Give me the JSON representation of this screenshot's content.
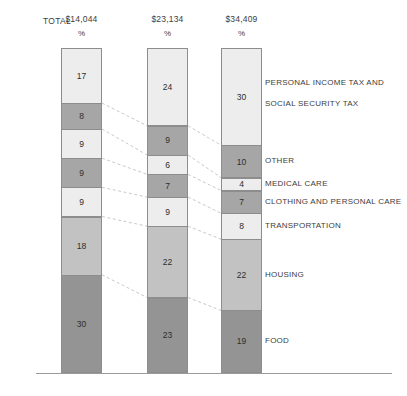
{
  "chart_data": {
    "type": "bar",
    "title": "",
    "subtitle": "",
    "xlabel": "",
    "ylabel": "",
    "grid": false,
    "legend_position": "right-labels",
    "stacked": true,
    "unit": "%",
    "ylim": [
      0,
      100
    ],
    "row_header": "TOTAL",
    "percent_symbol": "%",
    "categories": [
      "$14,044",
      "$23,134",
      "$34,409"
    ],
    "segment_labels": [
      "PERSONAL INCOME TAX AND\nSOCIAL SECURITY TAX",
      "OTHER",
      "MEDICAL CARE",
      "CLOTHING AND PERSONAL CARE",
      "TRANSPORTATION",
      "HOUSING",
      "FOOD"
    ],
    "series": [
      {
        "name": "PERSONAL INCOME TAX AND SOCIAL SECURITY TAX",
        "values": [
          17,
          24,
          30
        ],
        "color": "#ededed"
      },
      {
        "name": "OTHER",
        "values": [
          8,
          9,
          10
        ],
        "color": "#a6a6a6"
      },
      {
        "name": "MEDICAL CARE",
        "values": [
          9,
          6,
          4
        ],
        "color": "#ededed"
      },
      {
        "name": "CLOTHING AND PERSONAL CARE",
        "values": [
          9,
          7,
          7
        ],
        "color": "#a6a6a6"
      },
      {
        "name": "TRANSPORTATION",
        "values": [
          9,
          9,
          8
        ],
        "color": "#ededed"
      },
      {
        "name": "HOUSING",
        "values": [
          18,
          22,
          22
        ],
        "color": "#c2c2c2"
      },
      {
        "name": "FOOD",
        "values": [
          30,
          23,
          19
        ],
        "color": "#949494"
      }
    ]
  },
  "columns": [
    {
      "total": "$14,044",
      "percent_symbol": "%",
      "values": [
        17,
        8,
        9,
        9,
        9,
        18,
        30
      ]
    },
    {
      "total": "$23,134",
      "percent_symbol": "%",
      "values": [
        24,
        9,
        6,
        7,
        9,
        22,
        23
      ]
    },
    {
      "total": "$34,409",
      "percent_symbol": "%",
      "values": [
        30,
        10,
        4,
        7,
        8,
        22,
        19
      ]
    }
  ],
  "labels": {
    "total": "TOTAL",
    "cat0_line1": "PERSONAL INCOME TAX AND",
    "cat0_line2": "SOCIAL SECURITY TAX",
    "cat1": "OTHER",
    "cat2": "MEDICAL CARE",
    "cat3": "CLOTHING AND PERSONAL CARE",
    "cat4": "TRANSPORTATION",
    "cat5": "HOUSING",
    "cat6": "FOOD"
  },
  "colors": {
    "light": "#ededed",
    "medium": "#a6a6a6",
    "housing": "#c2c2c2",
    "food": "#949494",
    "stroke": "#8d8d8d",
    "connector": "#b0b0b0",
    "baseline": "#9a9a9a",
    "text": "#3d3d3d"
  },
  "values_flat": {
    "c0": [
      17,
      8,
      9,
      9,
      9,
      18,
      30
    ],
    "c1": [
      24,
      9,
      6,
      7,
      9,
      22,
      23
    ],
    "c2": [
      30,
      10,
      4,
      7,
      8,
      22,
      19
    ]
  }
}
